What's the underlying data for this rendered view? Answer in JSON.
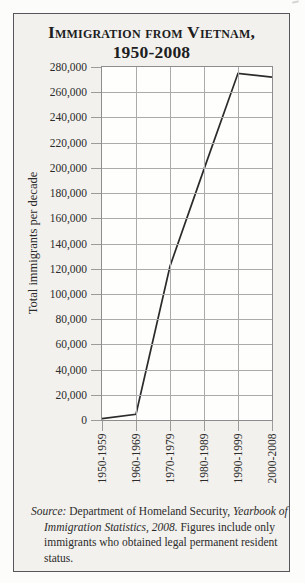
{
  "title": {
    "line1": "Immigration from Vietnam,",
    "line2": "1950-2008"
  },
  "chart_data": {
    "type": "line",
    "title": "Immigration from Vietnam, 1950-2008",
    "categories": [
      "1950-1959",
      "1960-1969",
      "1970-1979",
      "1980-1989",
      "1990-1999",
      "2000-2008"
    ],
    "values": [
      1000,
      4500,
      122000,
      199000,
      275000,
      272000
    ],
    "xlabel": "",
    "ylabel": "Total immigrants per decade",
    "ylim": [
      0,
      280000
    ],
    "y_tick_step": 20000,
    "y_tick_labels": [
      "0",
      "20,000",
      "40,000",
      "60,000",
      "80,000",
      "100,000",
      "120,000",
      "140,000",
      "160,000",
      "180,000",
      "200,000",
      "220,000",
      "240,000",
      "260,000",
      "280,000"
    ],
    "grid": true,
    "legend": "none",
    "line_color": "#2b2b2c"
  },
  "source": {
    "s1": "Source:",
    "s2": " Department of Homeland Security, ",
    "s3": "Yearbook of Immigration Statistics, 2008.",
    "s4": " Figures include only immigrants who obtained legal permanent resident status."
  },
  "colors": {
    "line": "#2b2b2c",
    "grid": "#ababab",
    "card_background": "#f2f1ee",
    "card_border": "#57575b",
    "text": "#2c2b29"
  }
}
